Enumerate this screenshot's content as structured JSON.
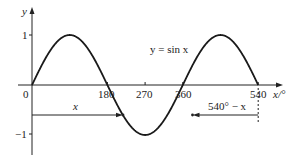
{
  "chart_data": {
    "type": "line",
    "title": "",
    "curve_label": "y = sin x",
    "xlabel": "x/°",
    "ylabel": "y",
    "xlim": [
      0,
      540
    ],
    "ylim": [
      -1,
      1
    ],
    "grid": false,
    "x_ticks": [
      "0",
      "180",
      "270",
      "360",
      "540"
    ],
    "y_ticks": [
      "1",
      "−1"
    ],
    "series": [
      {
        "name": "y = sin x",
        "x": [
          0,
          45,
          90,
          135,
          180,
          225,
          270,
          315,
          360,
          405,
          450,
          495,
          540
        ],
        "values": [
          0,
          0.71,
          1,
          0.71,
          0,
          -0.71,
          -1,
          -0.71,
          0,
          0.71,
          1,
          0.71,
          0
        ]
      }
    ],
    "annotations": [
      {
        "text": "x",
        "type": "arrow",
        "from_x": 0,
        "to_x": 217,
        "y": -0.6
      },
      {
        "text": "540° − x",
        "type": "arrow",
        "from_x": 540,
        "to_x": 323,
        "y": -0.6
      }
    ]
  },
  "labels": {
    "y_axis": "y",
    "x_axis": "x/°",
    "curve": "y = sin x",
    "origin": "0",
    "tick_180": "180",
    "tick_270": "270",
    "tick_360": "360",
    "tick_540": "540",
    "tick_y1": "1",
    "tick_ym1": "−1",
    "arrow_left": "x",
    "arrow_right": "540° − x"
  }
}
